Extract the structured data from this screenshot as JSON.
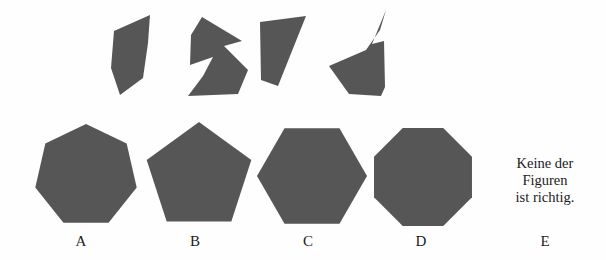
{
  "meta": {
    "item_type": "figure-assembly",
    "language": "de",
    "background_color": "#fefefe",
    "figure_fill_color": "#565656",
    "text_color": "#1b1b1b"
  },
  "prompt_pieces": {
    "count": 4,
    "items": [
      {
        "id": "piece-1",
        "name": "quadrilateral-sliver",
        "points": "40,6 4,22 1,59 10,86 33,69 38,34"
      },
      {
        "id": "piece-2",
        "name": "zigzag-arrow",
        "points": "16,4 5,22 4,52 27,44 17,63 2,83 52,81 62,57 38,33 56,28"
      },
      {
        "id": "piece-3",
        "name": "right-trapezoid",
        "points": "2,8 48,2 20,72 3,66"
      },
      {
        "id": "piece-4",
        "name": "spiked-polygon",
        "points": "58,2 44,36 56,33 57,79 53,88 21,86 1,58 38,42 52,22"
      }
    ],
    "placements": [
      {
        "piece": "piece-1",
        "x": 110,
        "y": 9,
        "w": 46,
        "h": 90
      },
      {
        "piece": "piece-2",
        "x": 186,
        "y": 13,
        "w": 66,
        "h": 86
      },
      {
        "piece": "piece-3",
        "x": 258,
        "y": 14,
        "w": 52,
        "h": 76
      },
      {
        "piece": "piece-4",
        "x": 328,
        "y": 8,
        "w": 62,
        "h": 92
      }
    ]
  },
  "options": [
    {
      "key": "A",
      "label": "A",
      "shape_name": "heptagon",
      "sides": 7,
      "x": 32,
      "y": 124,
      "w": 108,
      "h": 106,
      "label_x": 61,
      "label_y": 234,
      "polygon": {
        "cx": 54,
        "cy": 52,
        "r": 52,
        "n": 7,
        "rotation": -90
      }
    },
    {
      "key": "B",
      "label": "B",
      "shape_name": "pentagon",
      "sides": 5,
      "x": 146,
      "y": 122,
      "w": 106,
      "h": 108,
      "label_x": 175,
      "label_y": 234,
      "polygon": {
        "cx": 53,
        "cy": 55,
        "r": 55,
        "n": 5,
        "rotation": -90
      }
    },
    {
      "key": "C",
      "label": "C",
      "shape_name": "hexagon",
      "sides": 6,
      "x": 257,
      "y": 124,
      "w": 110,
      "h": 104,
      "label_x": 288,
      "label_y": 234,
      "polygon": {
        "cx": 55,
        "cy": 52,
        "r": 55,
        "n": 6,
        "rotation": 0
      }
    },
    {
      "key": "D",
      "label": "D",
      "shape_name": "octagon",
      "sides": 8,
      "x": 371,
      "y": 126,
      "w": 104,
      "h": 102,
      "label_x": 401,
      "label_y": 234,
      "polygon": {
        "cx": 52,
        "cy": 51,
        "r": 53,
        "n": 8,
        "rotation": 22.5
      }
    }
  ],
  "none_option": {
    "key": "E",
    "label": "E",
    "lines": [
      "Keine der",
      "Figuren",
      "ist richtig."
    ],
    "line_1": "Keine der",
    "line_2": "Figuren",
    "line_3": "ist richtig.",
    "label_x": 525,
    "label_y": 234
  }
}
